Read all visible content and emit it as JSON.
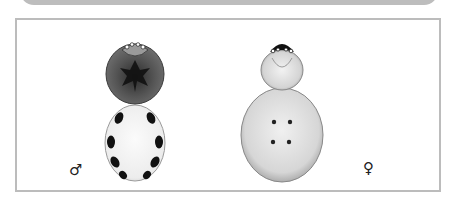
{
  "figure": {
    "panels": [
      {
        "subject": "male spider, dorsal view",
        "sex_symbol": "♂",
        "cephalothorax_color": "#5a5a5a",
        "abdomen_color": "#f4f4f4",
        "abdomen_spots": 8,
        "spot_color": "#111111"
      },
      {
        "subject": "female spider, dorsal view",
        "sex_symbol": "♀",
        "cephalothorax_color": "#dcdcdc",
        "abdomen_color": "#d6d6d6",
        "abdomen_spots": 4,
        "spot_color": "#222222"
      }
    ],
    "frame_color": "#bcbcbc",
    "top_bar_color": "#bdbdbd"
  }
}
